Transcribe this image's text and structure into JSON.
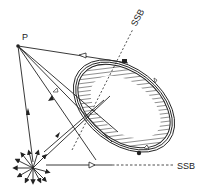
{
  "diagram": {
    "labels": {
      "point": "P",
      "ssb_top": "SSB",
      "ssb_bottom": "SSB"
    },
    "elements": {
      "source": "radiating-source",
      "object": "hatched-ellipse-object",
      "point": "observation-point-P"
    },
    "colors": {
      "ink": "#222222",
      "background": "#ffffff"
    }
  }
}
